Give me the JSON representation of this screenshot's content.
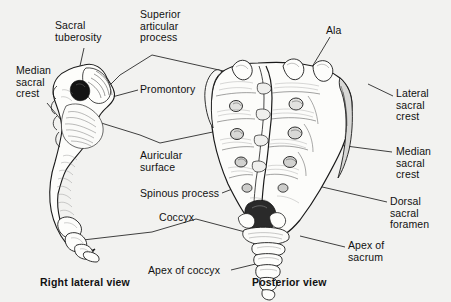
{
  "figure": {
    "background_color": "#f2f2f0",
    "ink_color": "#1a1a1a",
    "views": [
      {
        "id": "right-lateral",
        "caption": "Right lateral view"
      },
      {
        "id": "posterior",
        "caption": "Posterior view"
      }
    ],
    "labels": [
      {
        "id": "sacral-tuberosity",
        "text": "Sacral\ntuberosity",
        "x": 55,
        "y": 20,
        "align": "left"
      },
      {
        "id": "superior-articular-process",
        "text": "Superior\narticular\nprocess",
        "x": 140,
        "y": 9,
        "align": "left"
      },
      {
        "id": "ala",
        "text": "Ala",
        "x": 326,
        "y": 25,
        "align": "left"
      },
      {
        "id": "median-sacral-crest-left",
        "text": "Median\nsacral\ncrest",
        "x": 16,
        "y": 65,
        "align": "left"
      },
      {
        "id": "promontory",
        "text": "Promontory",
        "x": 140,
        "y": 84,
        "align": "left"
      },
      {
        "id": "lateral-sacral-crest",
        "text": "Lateral\nsacral\ncrest",
        "x": 396,
        "y": 88,
        "align": "left"
      },
      {
        "id": "median-sacral-crest-right",
        "text": "Median\nsacral\ncrest",
        "x": 396,
        "y": 146,
        "align": "left"
      },
      {
        "id": "auricular-surface",
        "text": "Auricular\nsurface",
        "x": 140,
        "y": 150,
        "align": "left"
      },
      {
        "id": "spinous-process",
        "text": "Spinous process",
        "x": 140,
        "y": 188,
        "align": "left"
      },
      {
        "id": "dorsal-sacral-foramen",
        "text": "Dorsal\nsacral\nforamen",
        "x": 390,
        "y": 196,
        "align": "left"
      },
      {
        "id": "coccyx",
        "text": "Coccyx",
        "x": 159,
        "y": 212,
        "align": "left"
      },
      {
        "id": "apex-of-sacrum",
        "text": "Apex of\nsacrum",
        "x": 348,
        "y": 240,
        "align": "left"
      },
      {
        "id": "apex-of-coccyx",
        "text": "Apex of coccyx",
        "x": 148,
        "y": 265,
        "align": "left"
      }
    ],
    "captions": [
      {
        "id": "caption-right-lateral",
        "text": "Right lateral view",
        "x": 40,
        "y": 277
      },
      {
        "id": "caption-posterior",
        "text": "Posterior view",
        "x": 252,
        "y": 277
      }
    ]
  }
}
